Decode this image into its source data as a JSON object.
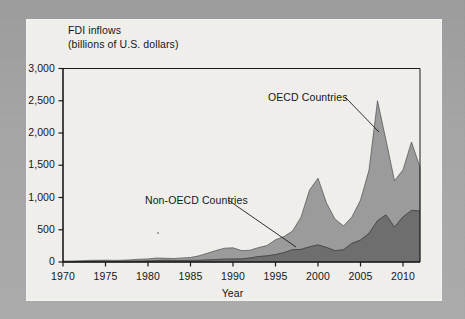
{
  "chart_data": {
    "type": "area",
    "stacked": true,
    "title": "FDI inflows",
    "subtitle": "(billions of U.S. dollars)",
    "xlabel": "Year",
    "ylabel": "",
    "xlim": [
      1970,
      2012
    ],
    "ylim": [
      0,
      3000
    ],
    "ytick_labels": [
      "0",
      "500",
      "1,000",
      "1,500",
      "2,000",
      "2,500",
      "3,000"
    ],
    "ytick_values": [
      0,
      500,
      1000,
      1500,
      2000,
      2500,
      3000
    ],
    "xtick_labels": [
      "1970",
      "1975",
      "1980",
      "1985",
      "1990",
      "1995",
      "2000",
      "2005",
      "2010"
    ],
    "xtick_values": [
      1970,
      1975,
      1980,
      1985,
      1990,
      1995,
      2000,
      2005,
      2010
    ],
    "grid": false,
    "legend_position": "annotations",
    "x": [
      1970,
      1971,
      1972,
      1973,
      1974,
      1975,
      1976,
      1977,
      1978,
      1979,
      1980,
      1981,
      1982,
      1983,
      1984,
      1985,
      1986,
      1987,
      1988,
      1989,
      1990,
      1991,
      1992,
      1993,
      1994,
      1995,
      1996,
      1997,
      1998,
      1999,
      2000,
      2001,
      2002,
      2003,
      2004,
      2005,
      2006,
      2007,
      2008,
      2009,
      2010,
      2011,
      2012
    ],
    "series": [
      {
        "name": "Non-OECD Countries",
        "color": "#6e6e6e",
        "values": [
          5,
          6,
          7,
          9,
          11,
          12,
          10,
          11,
          12,
          14,
          16,
          22,
          26,
          24,
          23,
          25,
          26,
          32,
          38,
          44,
          45,
          47,
          62,
          84,
          95,
          115,
          145,
          190,
          195,
          235,
          265,
          225,
          175,
          190,
          290,
          340,
          445,
          640,
          730,
          540,
          700,
          800,
          790
        ]
      },
      {
        "name": "OECD Countries",
        "color": "#9b9b9b",
        "values": [
          9,
          10,
          12,
          16,
          15,
          17,
          15,
          17,
          22,
          30,
          32,
          40,
          32,
          30,
          40,
          45,
          70,
          105,
          140,
          170,
          175,
          130,
          120,
          140,
          160,
          230,
          250,
          290,
          500,
          880,
          1035,
          690,
          490,
          370,
          410,
          620,
          980,
          1860,
          1160,
          720,
          730,
          1060,
          680
        ]
      }
    ],
    "annotations": [
      {
        "label": "OECD Countries",
        "target_year": 2006,
        "target_value": 2000
      },
      {
        "label": "Non-OECD Countries",
        "target_year": 2000,
        "target_value": 265
      }
    ]
  },
  "labels": {
    "y": [
      "3,000",
      "2,500",
      "2,000",
      "1,500",
      "1,000",
      "500",
      "0"
    ],
    "x": [
      "1970",
      "1975",
      "1980",
      "1985",
      "1990",
      "1995",
      "2000",
      "2005",
      "2010"
    ],
    "axis_x_title": "Year",
    "title_line1": "FDI inflows",
    "title_line2": "(billions of U.S. dollars)",
    "ann_oecd": "OECD Countries",
    "ann_nonoecd": "Non-OECD Countries"
  },
  "colors": {
    "page_background": "#a8a8a8",
    "card_background": "#f2f1ee",
    "axis": "#1a1a1a",
    "oecd_fill": "#9b9b9b",
    "nonoecd_fill": "#6e6e6e",
    "text": "#15161a"
  }
}
